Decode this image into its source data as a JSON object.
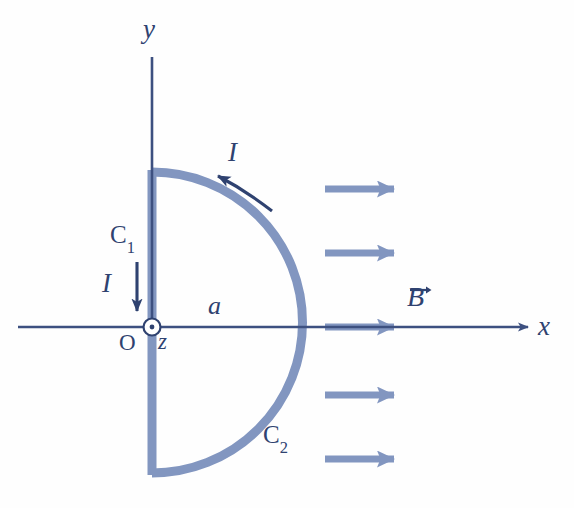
{
  "figure": {
    "type": "physics-diagram",
    "background_color": "#fefefe"
  },
  "colors": {
    "axis": "#3d5080",
    "wire": "#8296c0",
    "label": "#2f4270",
    "field_arrow": "#8296c0",
    "current_arrow": "#2f4270"
  },
  "axes": {
    "x_label": "x",
    "y_label": "y",
    "z_label": "z",
    "origin_label": "O",
    "origin_px": {
      "x": 152,
      "y": 327
    },
    "x_axis_start_px": {
      "x": 18,
      "y": 327
    },
    "x_axis_end_px": {
      "x": 536,
      "y": 327
    },
    "y_axis_start_px": {
      "x": 152,
      "y": 57
    },
    "y_axis_end_px": {
      "x": 152,
      "y": 327
    },
    "z_out_of_page": true
  },
  "geometry": {
    "radius_label": "a",
    "radius_px": 150,
    "arc_top_px": {
      "x": 152,
      "y": 172
    },
    "arc_bottom_px": {
      "x": 152,
      "y": 473
    },
    "arc_right_px": {
      "x": 302,
      "y": 327
    },
    "arc_span_degrees": 180,
    "arc_side": "right"
  },
  "segments": [
    {
      "name": "C1",
      "label": "C₁",
      "label_text": "C",
      "label_subscript": "1",
      "kind": "straight-wire",
      "description": "vertical straight segment along the y-axis (the diameter)"
    },
    {
      "name": "C2",
      "label": "C₂",
      "label_text": "C",
      "label_subscript": "2",
      "kind": "semicircular-arc",
      "description": "semicircular arc of radius a bulging in the +x direction"
    }
  ],
  "current": {
    "symbol": "I",
    "straight_label": "I",
    "arc_label": "I",
    "straight_direction": "down (-y) along C1",
    "arc_direction": "counterclockwise along C2 (toward -x at the top)"
  },
  "magnetic_field": {
    "symbol": "B",
    "label": "B",
    "vector_notation": true,
    "direction": "+x",
    "arrow_count": 5,
    "arrow_y_positions_px": [
      189,
      253,
      327,
      395,
      459
    ],
    "arrow_x_start_px": 325,
    "arrow_x_end_px": 410
  }
}
